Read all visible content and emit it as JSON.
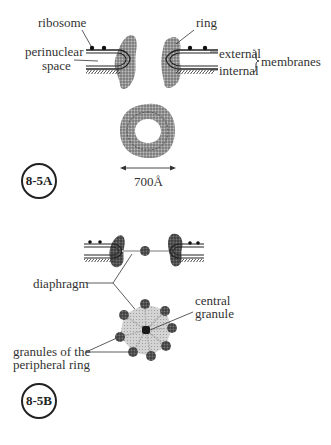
{
  "figure_a": {
    "labels": {
      "ribosome": "ribosome",
      "ring": "ring",
      "perinuclear_line1": "perinuclear",
      "perinuclear_line2": "space",
      "external": "external",
      "internal": "internal",
      "membranes": "membranes",
      "scale": "700Å"
    },
    "badge": "8-5A"
  },
  "figure_b": {
    "labels": {
      "diaphragm": "diaphragm",
      "central_line1": "central",
      "central_line2": "granule",
      "granules_line1": "granules of the",
      "granules_line2": "peripheral ring"
    },
    "badge": "8-5B"
  },
  "colors": {
    "ink": "#222222",
    "stipple": "#7a7a7a",
    "light_stipple": "#bdbdbd",
    "background": "#ffffff"
  }
}
